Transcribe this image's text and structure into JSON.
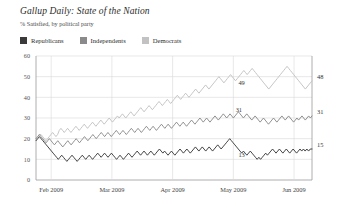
{
  "header": {
    "title": "Gallup Daily: State of the Nation",
    "subtitle": "% Satisfied, by political party"
  },
  "legend": {
    "position": "top-left",
    "items": [
      {
        "label": "Republicans",
        "color": "#3a3a3a"
      },
      {
        "label": "Independents",
        "color": "#8a8a8a"
      },
      {
        "label": "Democrats",
        "color": "#c2c2c2"
      }
    ]
  },
  "axis": {
    "y_ticks": [
      "0",
      "10",
      "20",
      "30",
      "40",
      "50",
      "60"
    ],
    "x_ticks": [
      "Feb 2009",
      "Mar 2009",
      "Apr 2009",
      "May 2009",
      "Jun 2009"
    ]
  },
  "annotations": {
    "mid_democrats": "49",
    "mid_independents": "31",
    "mid_republicans": "13",
    "end_democrats": "48",
    "end_independents": "31",
    "end_republicans": "15"
  },
  "chart_data": {
    "type": "line",
    "title": "Gallup Daily: State of the Nation",
    "subtitle": "% Satisfied, by political party",
    "xlabel": "",
    "ylabel": "",
    "ylim": [
      0,
      60
    ],
    "ytick_values": [
      0,
      10,
      20,
      30,
      40,
      50,
      60
    ],
    "grid": true,
    "legend_position": "top-left",
    "xtick_labels": [
      "Feb 2009",
      "Mar 2009",
      "Apr 2009",
      "May 2009",
      "Jun 2009"
    ],
    "xtick_positions": [
      0.055,
      0.275,
      0.495,
      0.715,
      0.935
    ],
    "series": [
      {
        "name": "Democrats",
        "color": "#c2c2c2",
        "end_label": "48",
        "mid_label": "49",
        "values": [
          20,
          21,
          22,
          22,
          21,
          20,
          19,
          20,
          21,
          22,
          23,
          22,
          21,
          22,
          24,
          25,
          24,
          23,
          24,
          25,
          24,
          23,
          24,
          25,
          26,
          25,
          24,
          25,
          26,
          27,
          26,
          25,
          26,
          27,
          28,
          27,
          26,
          27,
          28,
          29,
          28,
          27,
          28,
          29,
          30,
          29,
          28,
          29,
          30,
          31,
          30,
          31,
          32,
          31,
          30,
          31,
          32,
          33,
          32,
          31,
          32,
          33,
          34,
          35,
          34,
          33,
          34,
          35,
          36,
          35,
          34,
          35,
          36,
          37,
          38,
          37,
          36,
          37,
          38,
          39,
          38,
          37,
          38,
          39,
          40,
          41,
          40,
          39,
          40,
          41,
          42,
          41,
          40,
          41,
          42,
          43,
          44,
          43,
          42,
          43,
          44,
          45,
          46,
          45,
          44,
          45,
          46,
          47,
          48,
          49,
          50,
          49,
          48,
          47,
          48,
          49,
          50,
          51,
          50,
          49,
          48,
          49,
          50,
          51,
          52,
          53,
          52,
          51,
          52,
          53,
          54,
          53,
          52,
          51,
          50,
          49,
          48,
          47,
          46,
          45,
          44,
          45,
          46,
          47,
          48,
          49,
          50,
          51,
          52,
          53,
          54,
          55,
          54,
          53,
          52,
          51,
          50,
          49,
          48,
          47,
          46,
          45,
          44,
          45,
          46,
          47,
          48
        ]
      },
      {
        "name": "Independents",
        "color": "#8a8a8a",
        "end_label": "31",
        "mid_label": "31",
        "values": [
          20,
          21,
          22,
          21,
          20,
          19,
          18,
          19,
          20,
          19,
          18,
          17,
          18,
          19,
          18,
          17,
          16,
          17,
          18,
          19,
          18,
          17,
          18,
          19,
          20,
          19,
          18,
          19,
          20,
          21,
          20,
          19,
          20,
          21,
          22,
          21,
          20,
          21,
          22,
          23,
          22,
          21,
          22,
          23,
          22,
          21,
          22,
          23,
          24,
          23,
          22,
          23,
          24,
          23,
          22,
          23,
          24,
          25,
          24,
          23,
          24,
          25,
          24,
          23,
          24,
          25,
          26,
          25,
          24,
          25,
          26,
          25,
          24,
          25,
          26,
          27,
          26,
          25,
          26,
          27,
          26,
          25,
          26,
          27,
          28,
          27,
          26,
          27,
          28,
          27,
          26,
          27,
          28,
          29,
          28,
          27,
          28,
          29,
          30,
          29,
          28,
          29,
          30,
          29,
          28,
          29,
          30,
          31,
          30,
          29,
          30,
          31,
          32,
          31,
          30,
          31,
          32,
          31,
          30,
          31,
          32,
          33,
          32,
          31,
          30,
          31,
          32,
          31,
          30,
          29,
          30,
          31,
          30,
          29,
          28,
          29,
          30,
          29,
          28,
          27,
          28,
          29,
          30,
          29,
          28,
          29,
          30,
          31,
          30,
          29,
          30,
          31,
          30,
          29,
          28,
          29,
          30,
          29,
          30,
          31,
          30,
          29,
          30,
          31,
          30,
          31
        ]
      },
      {
        "name": "Republicans",
        "color": "#3a3a3a",
        "end_label": "15",
        "mid_label": "13",
        "values": [
          19,
          20,
          21,
          20,
          19,
          18,
          17,
          16,
          15,
          14,
          13,
          12,
          11,
          10,
          11,
          12,
          11,
          10,
          9,
          10,
          11,
          12,
          11,
          10,
          9,
          10,
          11,
          12,
          11,
          10,
          11,
          12,
          11,
          10,
          11,
          12,
          13,
          12,
          11,
          12,
          13,
          12,
          11,
          12,
          13,
          12,
          11,
          10,
          11,
          12,
          11,
          10,
          11,
          12,
          13,
          12,
          11,
          12,
          13,
          14,
          13,
          12,
          13,
          14,
          13,
          12,
          13,
          14,
          13,
          12,
          13,
          14,
          15,
          14,
          13,
          14,
          13,
          12,
          13,
          14,
          13,
          12,
          13,
          14,
          15,
          14,
          13,
          14,
          15,
          14,
          13,
          14,
          15,
          16,
          15,
          14,
          15,
          16,
          15,
          14,
          15,
          16,
          15,
          14,
          15,
          16,
          17,
          16,
          15,
          16,
          17,
          18,
          19,
          20,
          19,
          18,
          17,
          16,
          15,
          14,
          13,
          14,
          13,
          12,
          13,
          14,
          13,
          12,
          11,
          10,
          11,
          10,
          11,
          12,
          13,
          12,
          13,
          14,
          15,
          14,
          13,
          14,
          15,
          14,
          13,
          14,
          15,
          14,
          13,
          14,
          15,
          14,
          13,
          14,
          15,
          14,
          15,
          14,
          15,
          14,
          15,
          15
        ]
      }
    ]
  }
}
